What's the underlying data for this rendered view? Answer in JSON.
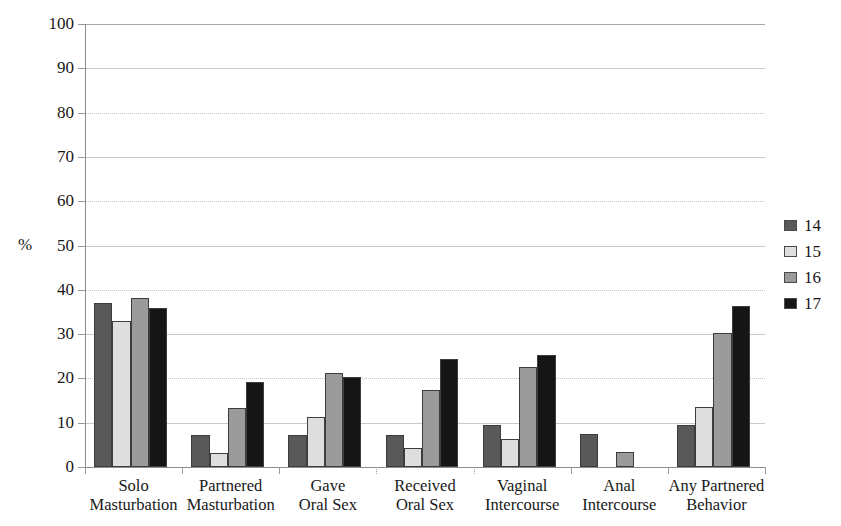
{
  "chart_data": {
    "type": "bar",
    "title": "",
    "xlabel": "",
    "ylabel": "%",
    "ylim": [
      0,
      100
    ],
    "ytick_step": 10,
    "yticks": [
      100,
      90,
      80,
      70,
      60,
      50,
      40,
      30,
      20,
      10,
      0
    ],
    "grid": true,
    "legend_position": "right",
    "categories": [
      "Solo\nMasturbation",
      "Partnered\nMasturbation",
      "Gave\nOral Sex",
      "Received\nOral Sex",
      "Vaginal\nIntercourse",
      "Anal\nIntercourse",
      "Any Partnered\nBehavior"
    ],
    "categories_flat": [
      "Solo Masturbation",
      "Partnered Masturbation",
      "Gave Oral Sex",
      "Received Oral Sex",
      "Vaginal Intercourse",
      "Anal Intercourse",
      "Any Partnered Behavior"
    ],
    "category_lines": [
      [
        "Solo",
        "Masturbation"
      ],
      [
        "Partnered",
        "Masturbation"
      ],
      [
        "Gave",
        "Oral Sex"
      ],
      [
        "Received",
        "Oral Sex"
      ],
      [
        "Vaginal",
        "Intercourse"
      ],
      [
        "Anal",
        "Intercourse"
      ],
      [
        "Any Partnered",
        "Behavior"
      ]
    ],
    "series": [
      {
        "name": "14",
        "color": "#595959",
        "values": [
          37.0,
          7.3,
          7.3,
          7.3,
          9.5,
          7.4,
          9.5
        ]
      },
      {
        "name": "15",
        "color": "#dedede",
        "values": [
          33.0,
          3.2,
          11.2,
          4.3,
          6.3,
          0,
          13.5
        ]
      },
      {
        "name": "16",
        "color": "#9b9b9b",
        "values": [
          38.2,
          13.4,
          21.3,
          17.3,
          22.5,
          3.3,
          30.3
        ]
      },
      {
        "name": "17",
        "color": "#151515",
        "values": [
          36.0,
          19.2,
          20.3,
          24.3,
          25.3,
          0,
          36.3
        ]
      }
    ]
  },
  "legend": {
    "items": [
      {
        "label": "14",
        "color": "#595959"
      },
      {
        "label": "15",
        "color": "#dedede"
      },
      {
        "label": "16",
        "color": "#9b9b9b"
      },
      {
        "label": "17",
        "color": "#151515"
      }
    ]
  },
  "axis": {
    "y_label": "%",
    "y_tick_labels": [
      "100",
      "90",
      "80",
      "70",
      "60",
      "50",
      "40",
      "30",
      "20",
      "10",
      "0"
    ]
  }
}
